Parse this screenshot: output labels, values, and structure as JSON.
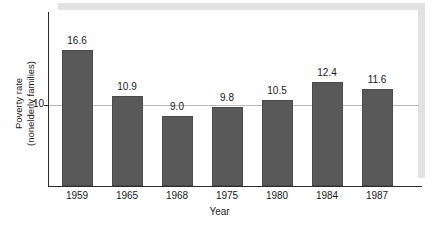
{
  "figure": {
    "background_color": "#ffffff",
    "bar_color": "#595959",
    "axis_color": "#2b2b2b",
    "gridline_color": "#b9b9b9",
    "shadow_color": "#e2e2e2"
  },
  "chart_data": {
    "type": "bar",
    "title": "",
    "subtitle": "",
    "categories": [
      "1959",
      "1965",
      "1968",
      "1975",
      "1980",
      "1984",
      "1987"
    ],
    "values": [
      16.6,
      10.9,
      9.0,
      9.8,
      10.5,
      12.4,
      11.6
    ],
    "value_labels": [
      "16.6",
      "10.9",
      "9.0",
      "9.8",
      "10.5",
      "12.4",
      "11.6"
    ],
    "xlabel": "Year",
    "ylabel": "Poverty rate (nonelderly families)",
    "ylabel_line1": "Poverty rate",
    "ylabel_line2": "(nonelderly families)",
    "ytick_labels": [
      "10"
    ],
    "ytick_values": [
      10
    ],
    "yscale": "log",
    "ylim": [
      5.2,
      19.5
    ],
    "grid": true,
    "gridlines_at": [
      10
    ],
    "legend": null,
    "legend_position": "none",
    "annotations": [],
    "series": [
      {
        "name": "Poverty rate (nonelderly families)",
        "values": [
          16.6,
          10.9,
          9.0,
          9.8,
          10.5,
          12.4,
          11.6
        ]
      }
    ]
  }
}
